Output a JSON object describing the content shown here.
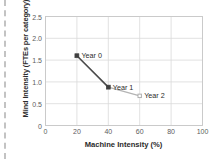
{
  "chart_data": {
    "type": "line",
    "title": "",
    "xlabel": "Machine Intensity (%)",
    "ylabel": "Mind Intensity (FTEs per category)",
    "xlim": [
      0,
      100
    ],
    "ylim": [
      0,
      2.5
    ],
    "xticks": [
      "0",
      "20",
      "40",
      "60",
      "80",
      "100"
    ],
    "xtick_values": [
      0,
      20,
      40,
      60,
      80,
      100
    ],
    "yticks": [
      "0",
      "0.5",
      "1.0",
      "1.5",
      "2.0",
      "2.5"
    ],
    "ytick_values": [
      0,
      0.5,
      1.0,
      1.5,
      2.0,
      2.5
    ],
    "grid": true,
    "legend": "none",
    "series": [
      {
        "name": "Mind vs Machine Intensity",
        "x": [
          20,
          40,
          60
        ],
        "y": [
          1.6,
          0.88,
          0.68
        ],
        "point_labels": [
          "Year 0",
          "Year 1",
          "Year 2"
        ]
      }
    ],
    "points": [
      {
        "label": "Year 0",
        "x": 20,
        "y": 1.6,
        "marker": "filled-square",
        "marker_color": "#3f3f3f"
      },
      {
        "label": "Year 1",
        "x": 40,
        "y": 0.88,
        "marker": "filled-square",
        "marker_color": "#3f3f3f"
      },
      {
        "label": "Year 2",
        "x": 60,
        "y": 0.68,
        "marker": "open-square",
        "marker_color": "#b0b0b0"
      }
    ],
    "segments": [
      {
        "from": "Year 0",
        "to": "Year 1",
        "color": "#4a4a4a",
        "width": 1.6
      },
      {
        "from": "Year 1",
        "to": "Year 2",
        "color": "#b4b4b4",
        "width": 1.3
      }
    ],
    "colors": {
      "dark_marker": "#3f3f3f",
      "light_marker": "#b0b0b0",
      "dark_line": "#4a4a4a",
      "light_line": "#b4b4b4",
      "gridline": "#d9d9d9",
      "plot_border": "#c8c8c8",
      "tick_text": "#5d5d5d",
      "axis_title_text": "#2b2b2b",
      "background": "#ffffff"
    }
  }
}
